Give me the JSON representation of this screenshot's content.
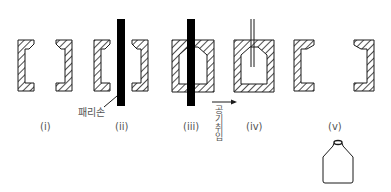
{
  "stages": [
    {
      "id": "i",
      "label": "(i)"
    },
    {
      "id": "ii",
      "label": "(ii)"
    },
    {
      "id": "iii",
      "label": "(iii)"
    },
    {
      "id": "iv",
      "label": "(iv)"
    },
    {
      "id": "v",
      "label": "(v)"
    }
  ],
  "annotations": {
    "parison": "패리손",
    "air_blow": "공기취입"
  },
  "colors": {
    "line": "#1a1a1a",
    "hatch": "#222222",
    "parison": "#000000",
    "label": "#555555"
  }
}
